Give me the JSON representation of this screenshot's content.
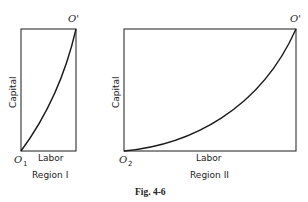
{
  "figure": {
    "caption": "Fig. 4-6",
    "panels": [
      {
        "region_label": "Region I",
        "x_axis_label": "Labor",
        "y_axis_label": "Capital",
        "origin_label": "O",
        "origin_subscript": "1",
        "corner_label": "O'",
        "curve": "convex from O1 to O' (nearly straight, slightly bowed)"
      },
      {
        "region_label": "Region II",
        "x_axis_label": "Labor",
        "y_axis_label": "Capital",
        "origin_label": "O",
        "origin_subscript": "2",
        "corner_label": "O'",
        "curve": "convex from O2 to O' (strongly bowed, rising steeply near O')"
      }
    ]
  },
  "colors": {
    "line": "#1a1a1a",
    "background": "#ffffff"
  }
}
